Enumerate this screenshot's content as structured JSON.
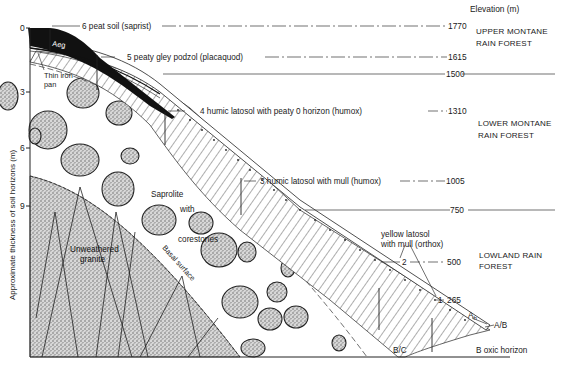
{
  "figure": {
    "y_axis": {
      "title": "Approximate thickness of soil horizons (m)",
      "ticks": [
        "0",
        "3",
        "6",
        "9"
      ]
    },
    "elevation_axis": {
      "title": "Elevation (m)",
      "values": [
        "1770",
        "1615",
        "1500",
        "1310",
        "1005",
        "750",
        "500",
        "265"
      ]
    },
    "vegetation_zones": [
      {
        "line1": "UPPER MONTANE",
        "line2": "RAIN FOREST"
      },
      {
        "line1": "LOWER MONTANE",
        "line2": "RAIN FOREST"
      },
      {
        "line1": "LOWLAND RAIN",
        "line2": "FOREST"
      }
    ],
    "soil_profiles": [
      {
        "number": "6",
        "label": "6 peat soil (saprist)",
        "elevation": "1770"
      },
      {
        "number": "5",
        "label": "5  peaty gley podzol (placaquod)",
        "elevation": "1615"
      },
      {
        "number": "4",
        "label": "4 humic latosol with peaty 0 horizon (humox)",
        "elevation": "1310"
      },
      {
        "number": "3",
        "label": "3 humic latosol with mull (humox)",
        "elevation": "1005"
      },
      {
        "number": "2",
        "label": "2",
        "elevation": "500"
      },
      {
        "number": "1",
        "label": "1",
        "elevation": "265"
      }
    ],
    "yellow_latosol_label": {
      "line1": "yellow latosol",
      "line2": "with mull (orthox)"
    },
    "features": {
      "aeg": "Aeg",
      "iron_pan_line1": "Thin iron",
      "iron_pan_line2": "pan",
      "saprolite_line1": "Saprolite",
      "saprolite_line2": "with",
      "saprolite_line3": "corestones",
      "unweathered_line1": "Unweathered",
      "unweathered_line2": "granite",
      "basal_surface": "Basal surface"
    },
    "horizons": {
      "a": "A",
      "a_sub": "h",
      "ab": "A/B",
      "bc": "B/C",
      "b_oxic": "B oxic horizon"
    }
  }
}
